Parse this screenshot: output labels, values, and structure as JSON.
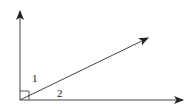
{
  "diagram": {
    "type": "geometry-angles",
    "labels": {
      "angle1": "1",
      "angle2": "2"
    },
    "right_angle_marker": true,
    "colors": {
      "line": "#333333",
      "background": "#ffffff"
    }
  }
}
